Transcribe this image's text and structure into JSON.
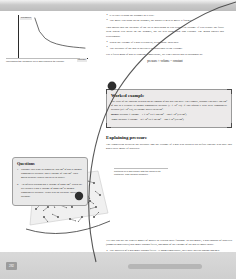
{
  "document": {
    "page_number": "282",
    "figure": {
      "caption": "Increasing the pressure on a gas reduces its volume.",
      "y_axis_label": "pressure",
      "x_axis_label": "volume"
    },
    "intro_bullets": [
      "It is easy to push the plunger in a little.",
      "The more you push on the plunger, the harder it gets to move it further."
    ],
    "paragraph_1": "This shows that the pressure of the air is increasing as you reduce its volume. If you reduce the force with which you press on the plunger, the air will push back and expand. The graph shows this relationship.",
    "relationship_bullets": [
      "When the volume of a gas is reduced, its pressure increases.",
      "The pressure of the gas is inversely proportional to the volume."
    ],
    "paragraph_2": "For a fixed mass of gas at constant temperature, we can express this relationship as:",
    "equation": "pressure × volume = constant"
  },
  "worked_example": {
    "title": "Worked example",
    "body": "The value of the constant depends on the amount of gas that you have. For example, suppose you have 100 cm³ of gas in a cylinder at normal atmospheric pressure (1 × 10⁵ Pa). If you squash it with twice atmospheric pressure (2 × 10⁵ Pa), its volume halves to 50 cm³.",
    "result_before_label": "Before:",
    "result_before": "pressure × volume = 1 × 10⁵ Pa × 100 cm³ = 100 × 10⁵ (Pa cm³)",
    "result_after_label": "After:",
    "result_after": "pressure × volume = 2 × 10⁵ Pa × 50 cm³ = 100 × 10⁵ (Pa cm³)"
  },
  "explaining_pressure": {
    "title": "Explaining pressure",
    "body": "The connection between the pressure and the volume of a gas was worked out before anyone was sure that gases were made of particles.",
    "diagram_caption": "Particles of a gas collide with the walls of its container. This causes pressure."
  },
  "questions": {
    "title": "Questions",
    "items": [
      "Suppose you want to compress 300 cm³ of gas at normal atmospheric pressure into a volume of 100 cm³. How much pressure would you need to apply?",
      "An inflated balloon has a volume of 2000 cm³. When the air escapes it has a volume of 4000 cm³ at normal atmospheric pressure. What was the pressure inside the balloon?"
    ]
  },
  "bottom": {
    "paragraph": "Yet you can use the kinetic model of matter to explain these findings. In this model, a gas consists of particles (atoms or molecules) that move around freely, and most of the volume of the gas is empty space.",
    "bullets": [
      "The particles of a gas move around freely. At room temperature, they have speeds around 500 m/s."
    ],
    "bold_term": "kinetic model"
  },
  "chart_data": {
    "type": "line",
    "title": "",
    "xlabel": "volume",
    "ylabel": "pressure",
    "x": [
      0.12,
      0.2,
      0.3,
      0.4,
      0.5,
      0.6,
      0.7,
      0.8,
      0.9,
      1.0
    ],
    "y": [
      1.0,
      0.62,
      0.42,
      0.32,
      0.26,
      0.22,
      0.19,
      0.17,
      0.155,
      0.14
    ],
    "xlim": [
      0,
      1
    ],
    "ylim": [
      0,
      1
    ],
    "grid": false,
    "legend": "none",
    "note": "Inverse proportionality: pressure × volume = constant (Boyle's Law)"
  },
  "colors": {
    "chrome_band": "#cfcfcf",
    "box_fill": "#eceaea",
    "question_fill": "#e9e9e9",
    "text": "#1d1d1d",
    "curve": "#2b2b2b"
  }
}
